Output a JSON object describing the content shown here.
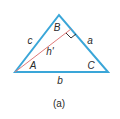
{
  "diagram": {
    "caption": "(a)",
    "colors": {
      "triangle": "#3aa6d8",
      "altitude": "#e07a7a",
      "right_angle": "#333333",
      "text": "#2a2a2a"
    },
    "vertices": {
      "A": {
        "label": "A"
      },
      "B": {
        "label": "B"
      },
      "C": {
        "label": "C"
      }
    },
    "sides": {
      "a": {
        "label": "a"
      },
      "b": {
        "label": "b"
      },
      "c": {
        "label": "c"
      }
    },
    "altitude": {
      "label": "h'"
    }
  }
}
